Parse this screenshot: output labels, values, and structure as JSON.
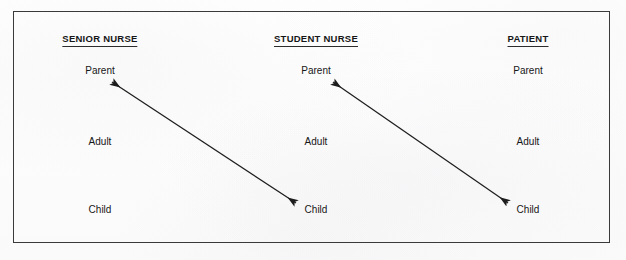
{
  "diagram": {
    "title_present": false,
    "frame": {
      "stroke": "#3a3a3a"
    },
    "columns": [
      {
        "id": "senior-nurse",
        "header": "SENIOR NURSE",
        "center_x": 100,
        "states": [
          {
            "label": "Parent",
            "y": 71
          },
          {
            "label": "Adult",
            "y": 142
          },
          {
            "label": "Child",
            "y": 210
          }
        ]
      },
      {
        "id": "student-nurse",
        "header": "STUDENT NURSE",
        "center_x": 316,
        "states": [
          {
            "label": "Parent",
            "y": 71
          },
          {
            "label": "Adult",
            "y": 142
          },
          {
            "label": "Child",
            "y": 210
          }
        ]
      },
      {
        "id": "patient",
        "header": "PATIENT",
        "center_x": 528,
        "states": [
          {
            "label": "Parent",
            "y": 71
          },
          {
            "label": "Adult",
            "y": 142
          },
          {
            "label": "Child",
            "y": 210
          }
        ]
      }
    ],
    "header_y": 40,
    "transactions": [
      {
        "id": "senior-parent-to-student-child",
        "from": "SENIOR NURSE / Parent",
        "to": "STUDENT NURSE / Child",
        "style": "double-headed-arrow",
        "x1": 112,
        "y1": 82,
        "x2": 296,
        "y2": 203,
        "stroke": "#1d1d1d"
      },
      {
        "id": "student-parent-to-patient-child",
        "from": "STUDENT NURSE / Parent",
        "to": "PATIENT / Child",
        "style": "double-headed-arrow",
        "x1": 333,
        "y1": 82,
        "x2": 508,
        "y2": 203,
        "stroke": "#1d1d1d"
      }
    ]
  }
}
